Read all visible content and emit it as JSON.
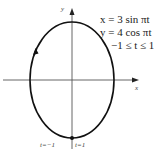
{
  "diagram": {
    "type": "parametric-curve",
    "equations": {
      "x": "x = 3 sin πt",
      "y": "y = 4 cos πt",
      "range": "−1 ≤ t ≤ 1"
    },
    "axes": {
      "x_label": "x",
      "y_label": "y"
    },
    "points": {
      "start_label": "t=−1",
      "end_label": "t=1"
    },
    "curve": {
      "shape": "ellipse",
      "semi_x": 3,
      "semi_y": 4,
      "direction": "counterclockwise-arrow-on-left",
      "color": "#111111"
    }
  }
}
